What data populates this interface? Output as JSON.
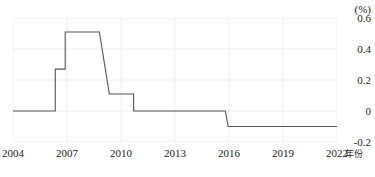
{
  "chart_data": {
    "type": "line",
    "title": "",
    "subtitle": "",
    "xlabel": "年份",
    "ylabel": "(%)",
    "unit": "(%)",
    "step_style": "step-like rate schedule",
    "xlim": [
      2004,
      2022
    ],
    "ylim": [
      -0.2,
      0.6
    ],
    "yticks": [
      "0.6",
      "0.4",
      "0.2",
      "0",
      "-0.2"
    ],
    "ytick_values": [
      0.6,
      0.4,
      0.2,
      0,
      -0.2
    ],
    "xticks": [
      "2004",
      "2007",
      "2010",
      "2013",
      "2016",
      "2019",
      "2022"
    ],
    "xtick_values": [
      2004,
      2007,
      2010,
      2013,
      2016,
      2019,
      2022
    ],
    "grid": true,
    "legend": "none",
    "series": [
      {
        "name": "rate",
        "color": "#555555",
        "x": [
          2004.0,
          2006.35,
          2006.35,
          2006.9,
          2006.9,
          2007.25,
          2008.8,
          2009.35,
          2009.35,
          2010.7,
          2010.7,
          2015.8,
          2015.95,
          2022.0
        ],
        "values": [
          0.0,
          0.0,
          0.27,
          0.27,
          0.51,
          0.51,
          0.51,
          0.11,
          0.11,
          0.11,
          0.0,
          0.0,
          -0.1,
          -0.1
        ]
      }
    ],
    "annotations": []
  },
  "axes": {
    "y_unit_label": "(%)",
    "x_axis_name": "年份"
  },
  "colors": {
    "line": "#555555",
    "grid": "#eceff3",
    "text": "#1a1a1a",
    "background": "#ffffff"
  }
}
